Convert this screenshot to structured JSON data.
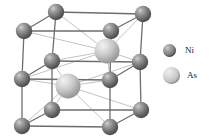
{
  "figure": {
    "background_color": "#ffffff"
  },
  "legend": {
    "items": [
      {
        "key": "ni",
        "label": "Ni",
        "color": "#7e7e7e",
        "radius": 6.5,
        "icon": "sphere-icon"
      },
      {
        "key": "as",
        "label": "As",
        "color": "#c3c3c3",
        "radius": 8.5,
        "icon": "sphere-icon"
      }
    ]
  },
  "structure": {
    "cell_edge_color": "#6e6e6e",
    "bond_color": "#b4b4b4",
    "atoms": [
      {
        "id": "ni1",
        "element": "Ni",
        "cx": 56,
        "cy": 12,
        "r": 8.2
      },
      {
        "id": "ni2",
        "element": "Ni",
        "cx": 143,
        "cy": 14,
        "r": 8.2
      },
      {
        "id": "ni3",
        "element": "Ni",
        "cx": 24,
        "cy": 31,
        "r": 8.2
      },
      {
        "id": "ni4",
        "element": "Ni",
        "cx": 111,
        "cy": 31,
        "r": 8.2
      },
      {
        "id": "ni5",
        "element": "Ni",
        "cx": 52,
        "cy": 61,
        "r": 8.2
      },
      {
        "id": "ni6",
        "element": "Ni",
        "cx": 140,
        "cy": 62,
        "r": 8.2
      },
      {
        "id": "ni7",
        "element": "Ni",
        "cx": 22,
        "cy": 79,
        "r": 8.2
      },
      {
        "id": "ni8",
        "element": "Ni",
        "cx": 110,
        "cy": 80,
        "r": 8.2
      },
      {
        "id": "ni9",
        "element": "Ni",
        "cx": 52,
        "cy": 110,
        "r": 8.2
      },
      {
        "id": "ni10",
        "element": "Ni",
        "cx": 141,
        "cy": 110,
        "r": 8.2
      },
      {
        "id": "ni11",
        "element": "Ni",
        "cx": 22,
        "cy": 126,
        "r": 8.2
      },
      {
        "id": "ni12",
        "element": "Ni",
        "cx": 110,
        "cy": 127,
        "r": 8.2
      },
      {
        "id": "as1",
        "element": "As",
        "cx": 107,
        "cy": 51,
        "r": 12.5
      },
      {
        "id": "as2",
        "element": "As",
        "cx": 68,
        "cy": 86,
        "r": 12.5
      }
    ],
    "cell_edges": [
      {
        "from": "ni1",
        "to": "ni2"
      },
      {
        "from": "ni1",
        "to": "ni3"
      },
      {
        "from": "ni2",
        "to": "ni4"
      },
      {
        "from": "ni3",
        "to": "ni4"
      },
      {
        "from": "ni1",
        "to": "ni5"
      },
      {
        "from": "ni2",
        "to": "ni6"
      },
      {
        "from": "ni3",
        "to": "ni7"
      },
      {
        "from": "ni4",
        "to": "ni8"
      },
      {
        "from": "ni5",
        "to": "ni9"
      },
      {
        "from": "ni6",
        "to": "ni10"
      },
      {
        "from": "ni7",
        "to": "ni11"
      },
      {
        "from": "ni8",
        "to": "ni12"
      },
      {
        "from": "ni5",
        "to": "ni6"
      },
      {
        "from": "ni5",
        "to": "ni7"
      },
      {
        "from": "ni6",
        "to": "ni8"
      },
      {
        "from": "ni7",
        "to": "ni8"
      },
      {
        "from": "ni9",
        "to": "ni10"
      },
      {
        "from": "ni9",
        "to": "ni11"
      },
      {
        "from": "ni10",
        "to": "ni12"
      },
      {
        "from": "ni11",
        "to": "ni12"
      }
    ],
    "bonds": [
      {
        "from": "as1",
        "to": "ni1"
      },
      {
        "from": "as1",
        "to": "ni2"
      },
      {
        "from": "as1",
        "to": "ni3"
      },
      {
        "from": "as1",
        "to": "ni4"
      },
      {
        "from": "as1",
        "to": "ni5"
      },
      {
        "from": "as1",
        "to": "ni6"
      },
      {
        "from": "as1",
        "to": "ni7"
      },
      {
        "from": "as1",
        "to": "ni8"
      },
      {
        "from": "as2",
        "to": "ni5"
      },
      {
        "from": "as2",
        "to": "ni6"
      },
      {
        "from": "as2",
        "to": "ni7"
      },
      {
        "from": "as2",
        "to": "ni8"
      },
      {
        "from": "as2",
        "to": "ni9"
      },
      {
        "from": "as2",
        "to": "ni10"
      },
      {
        "from": "as2",
        "to": "ni11"
      },
      {
        "from": "as2",
        "to": "ni12"
      }
    ]
  }
}
